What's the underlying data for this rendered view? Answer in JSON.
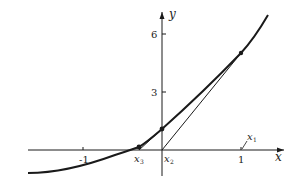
{
  "figure": {
    "axes": {
      "x_label": "x",
      "y_label": "y",
      "x_ticks": [
        {
          "value": -1,
          "label": "-1"
        },
        {
          "value": 1,
          "label": "1"
        }
      ],
      "y_ticks": [
        {
          "value": 3,
          "label": "3"
        },
        {
          "value": 6,
          "label": "6"
        }
      ]
    },
    "annotations": {
      "x1": "x",
      "x1_sub": "1",
      "x2": "x",
      "x2_sub": "2",
      "x3": "x",
      "x3_sub": "3"
    },
    "curve": {
      "points_px": [
        [
          28,
          173
        ],
        [
          60,
          170
        ],
        [
          90,
          163
        ],
        [
          115,
          155
        ],
        [
          139,
          147
        ],
        [
          162,
          129
        ],
        [
          190,
          102
        ],
        [
          215,
          80
        ],
        [
          241,
          53
        ],
        [
          268,
          15
        ]
      ],
      "marked_points": [
        {
          "name": "point-at-x1",
          "px": [
            241,
            53
          ]
        },
        {
          "name": "point-at-x2",
          "px": [
            162,
            129
          ]
        },
        {
          "name": "point-at-x3",
          "px": [
            139,
            147
          ]
        }
      ]
    },
    "tangents": [
      {
        "name": "tangent-from-x1",
        "from_px": [
          241,
          53
        ],
        "to_px": [
          162,
          150
        ]
      },
      {
        "name": "tangent-from-x2",
        "from_px": [
          162,
          129
        ],
        "to_px": [
          139,
          150
        ]
      }
    ],
    "colors": {
      "ink": "#1a1a1a",
      "background": "#ffffff"
    }
  }
}
